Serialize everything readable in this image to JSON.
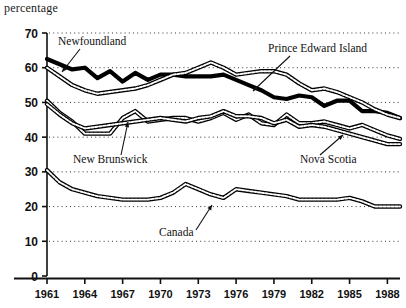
{
  "axis_label_y": "percentage",
  "chart_data": {
    "type": "line",
    "title": "",
    "subtitle": "",
    "xlabel": "",
    "ylabel": "percentage",
    "ylim": [
      0,
      70
    ],
    "xlim": [
      1961,
      1989
    ],
    "grid": "horizontal-dotted",
    "legend_position": "inline-annotations",
    "yticks": [
      0,
      10,
      20,
      30,
      40,
      50,
      60,
      70
    ],
    "ytick_labels": [
      "0",
      "10",
      "20",
      "30",
      "40",
      "50",
      "60",
      "70"
    ],
    "xticks": [
      1961,
      1964,
      1967,
      1970,
      1973,
      1976,
      1979,
      1982,
      1985,
      1988
    ],
    "xtick_labels": [
      "1961",
      "1964",
      "1967",
      "1970",
      "1973",
      "1976",
      "1979",
      "1982",
      "1985",
      "1988"
    ],
    "x": [
      1961,
      1962,
      1963,
      1964,
      1965,
      1966,
      1967,
      1968,
      1969,
      1970,
      1971,
      1972,
      1973,
      1974,
      1975,
      1976,
      1977,
      1978,
      1979,
      1980,
      1981,
      1982,
      1983,
      1984,
      1985,
      1986,
      1987,
      1988,
      1989
    ],
    "series": [
      {
        "name": "Newfoundland",
        "style": "thick-solid-black",
        "values": [
          62.5,
          61.0,
          59.5,
          60.0,
          57.0,
          59.0,
          56.0,
          58.5,
          56.5,
          58.0,
          58.0,
          57.5,
          57.5,
          57.5,
          58.0,
          56.5,
          55.0,
          53.5,
          51.5,
          51.0,
          52.0,
          51.5,
          49.0,
          50.5,
          50.5,
          47.5,
          47.5,
          47.0,
          45.5
        ]
      },
      {
        "name": "Prince Edward Island",
        "style": "outlined-white",
        "values": [
          60.0,
          57.5,
          55.0,
          53.5,
          52.5,
          53.0,
          53.5,
          54.0,
          55.0,
          56.5,
          58.0,
          58.5,
          60.0,
          61.5,
          60.0,
          58.0,
          58.5,
          59.0,
          59.0,
          58.0,
          55.5,
          53.5,
          54.0,
          53.0,
          51.5,
          50.0,
          48.0,
          46.5,
          45.5
        ]
      },
      {
        "name": "New Brunswick",
        "style": "outlined-white",
        "values": [
          50.5,
          47.0,
          44.5,
          41.0,
          41.0,
          41.0,
          45.5,
          47.5,
          44.5,
          45.0,
          45.5,
          45.5,
          44.5,
          45.5,
          47.0,
          45.0,
          46.5,
          44.0,
          43.5,
          46.5,
          44.0,
          44.0,
          44.5,
          43.5,
          42.5,
          43.5,
          42.0,
          40.5,
          39.5
        ]
      },
      {
        "name": "Nova Scotia",
        "style": "outlined-white",
        "values": [
          49.5,
          46.5,
          44.0,
          42.5,
          43.0,
          43.5,
          44.0,
          44.5,
          45.0,
          45.5,
          45.0,
          44.5,
          45.5,
          46.0,
          47.5,
          46.0,
          46.0,
          45.5,
          44.0,
          45.0,
          43.0,
          43.5,
          43.0,
          42.0,
          41.0,
          40.0,
          39.0,
          38.0,
          38.0
        ]
      },
      {
        "name": "Canada",
        "style": "outlined-white",
        "values": [
          30.5,
          27.0,
          25.0,
          24.0,
          23.0,
          22.5,
          22.0,
          22.0,
          22.0,
          22.5,
          24.0,
          26.5,
          25.0,
          23.5,
          22.5,
          25.0,
          24.5,
          24.0,
          23.5,
          23.0,
          22.0,
          22.0,
          22.0,
          22.0,
          22.5,
          21.5,
          20.0,
          20.0,
          20.0
        ]
      }
    ],
    "annotations": [
      {
        "label": "Newfoundland",
        "target_series": "Newfoundland"
      },
      {
        "label": "Prince Edward Island",
        "target_series": "Prince Edward Island"
      },
      {
        "label": "New Brunswick",
        "target_series": "New Brunswick"
      },
      {
        "label": "Nova Scotia",
        "target_series": "Nova Scotia"
      },
      {
        "label": "Canada",
        "target_series": "Canada"
      }
    ]
  }
}
